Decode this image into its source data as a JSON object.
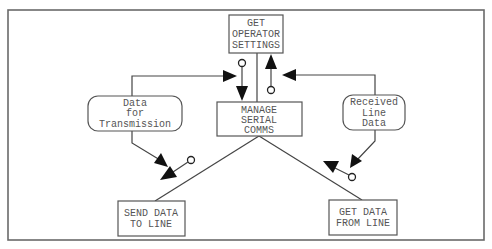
{
  "diagram": {
    "type": "structure-chart",
    "modules": {
      "get_operator_settings": {
        "lines": [
          "GET",
          "OPERATOR",
          "SETTINGS"
        ]
      },
      "manage_serial_comms": {
        "lines": [
          "MANAGE",
          "SERIAL",
          "COMMS"
        ]
      },
      "send_data_to_line": {
        "lines": [
          "SEND DATA",
          "TO LINE"
        ]
      },
      "get_data_from_line": {
        "lines": [
          "GET DATA",
          "FROM LINE"
        ]
      }
    },
    "data_stores": {
      "data_for_transmission": {
        "lines": [
          "Data",
          "for",
          "Transmission"
        ]
      },
      "received_line_data": {
        "lines": [
          "Received",
          "Line",
          "Data"
        ]
      }
    },
    "connections": [
      {
        "from": "MANAGE SERIAL COMMS",
        "to": "GET OPERATOR SETTINGS"
      },
      {
        "from": "MANAGE SERIAL COMMS",
        "to": "SEND DATA TO LINE"
      },
      {
        "from": "MANAGE SERIAL COMMS",
        "to": "GET DATA FROM LINE"
      }
    ],
    "couples": [
      {
        "direction": "down",
        "between": "GET OPERATOR SETTINGS → MANAGE SERIAL COMMS"
      },
      {
        "direction": "up",
        "between": "MANAGE SERIAL COMMS → GET OPERATOR SETTINGS"
      },
      {
        "direction": "down-left",
        "near": "SEND DATA TO LINE"
      },
      {
        "direction": "up-left",
        "near": "GET DATA FROM LINE"
      }
    ],
    "colors": {
      "line": "#444444",
      "text": "#555555",
      "frame": "#6a6a6a",
      "arrowhead": "#111111"
    }
  }
}
